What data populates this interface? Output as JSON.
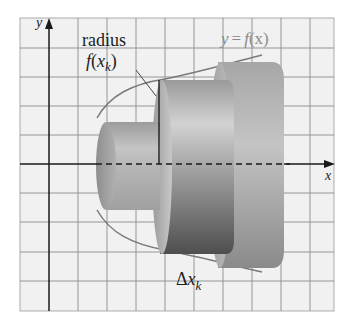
{
  "figure": {
    "type": "solid-of-revolution-disk-method",
    "axes": {
      "x_label": "x",
      "y_label": "y"
    },
    "labels": {
      "radius_word": "radius",
      "radius_expr_f": "f",
      "radius_expr_open": "(",
      "radius_expr_x": "x",
      "radius_expr_sub": "k",
      "radius_expr_close": ")",
      "curve_y": "y",
      "curve_eq": "=",
      "curve_f": "f",
      "curve_arg": "(x)",
      "delta_symbol": "Δ",
      "delta_x": "x",
      "delta_sub": "k"
    },
    "colors": {
      "background": "#ffffff",
      "grid_fill": "#f1f1f1",
      "grid_line": "#8c8c8c",
      "axis": "#1a1a1a",
      "curve": "#7a7a7a",
      "disk_light": "#d4d4d4",
      "disk_mid": "#a8a8a8",
      "disk_dark": "#5c5c5c"
    },
    "disks": [
      {
        "name": "small-disk",
        "radius": 1.5
      },
      {
        "name": "middle-disk",
        "radius": 2.95
      },
      {
        "name": "large-disk",
        "radius": 3.55
      }
    ]
  }
}
